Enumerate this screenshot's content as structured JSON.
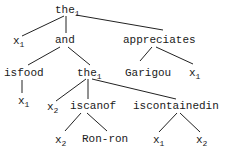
{
  "diagram": {
    "type": "tree",
    "nodes": [
      {
        "id": "n0",
        "label": "the",
        "sub": "1",
        "x": 55,
        "y": 4
      },
      {
        "id": "n1",
        "label": "x",
        "sub": "1",
        "x": 13,
        "y": 35
      },
      {
        "id": "n2",
        "label": "and",
        "sub": "",
        "x": 55,
        "y": 34
      },
      {
        "id": "n3",
        "label": "appreciates",
        "sub": "",
        "x": 123,
        "y": 34
      },
      {
        "id": "n4",
        "label": "isfood",
        "sub": "",
        "x": 4,
        "y": 67
      },
      {
        "id": "n5",
        "label": "the",
        "sub": "1",
        "x": 77,
        "y": 67
      },
      {
        "id": "n6",
        "label": "Garigou",
        "sub": "",
        "x": 125,
        "y": 67
      },
      {
        "id": "n7",
        "label": "x",
        "sub": "1",
        "x": 189,
        "y": 67
      },
      {
        "id": "n8",
        "label": "x",
        "sub": "1",
        "x": 18,
        "y": 95
      },
      {
        "id": "n9",
        "label": "x",
        "sub": "2",
        "x": 47,
        "y": 101
      },
      {
        "id": "n10",
        "label": "iscanof",
        "sub": "",
        "x": 70,
        "y": 100
      },
      {
        "id": "n11",
        "label": "iscontainedin",
        "sub": "",
        "x": 133,
        "y": 100
      },
      {
        "id": "n12",
        "label": "x",
        "sub": "2",
        "x": 55,
        "y": 134
      },
      {
        "id": "n13",
        "label": "Ron-ron",
        "sub": "",
        "x": 82,
        "y": 133
      },
      {
        "id": "n14",
        "label": "x",
        "sub": "1",
        "x": 153,
        "y": 134
      },
      {
        "id": "n15",
        "label": "x",
        "sub": "2",
        "x": 196,
        "y": 134
      }
    ],
    "edges": [
      {
        "from": "n0",
        "to": "n1",
        "x1": 64,
        "y1": 16,
        "x2": 22,
        "y2": 36
      },
      {
        "from": "n0",
        "to": "n2",
        "x1": 66,
        "y1": 16,
        "x2": 66,
        "y2": 33
      },
      {
        "from": "n0",
        "to": "n3",
        "x1": 76,
        "y1": 15,
        "x2": 163,
        "y2": 30
      },
      {
        "from": "n2",
        "to": "n4",
        "x1": 60,
        "y1": 47,
        "x2": 28,
        "y2": 65
      },
      {
        "from": "n2",
        "to": "n5",
        "x1": 68,
        "y1": 47,
        "x2": 90,
        "y2": 65
      },
      {
        "from": "n3",
        "to": "n6",
        "x1": 152,
        "y1": 47,
        "x2": 140,
        "y2": 61
      },
      {
        "from": "n3",
        "to": "n7",
        "x1": 156,
        "y1": 47,
        "x2": 193,
        "y2": 64
      },
      {
        "from": "n4",
        "to": "n8",
        "x1": 22,
        "y1": 80,
        "x2": 22,
        "y2": 93
      },
      {
        "from": "n5",
        "to": "n9",
        "x1": 86,
        "y1": 79,
        "x2": 56,
        "y2": 101
      },
      {
        "from": "n5",
        "to": "n10",
        "x1": 88,
        "y1": 79,
        "x2": 88,
        "y2": 99
      },
      {
        "from": "n5",
        "to": "n11",
        "x1": 92,
        "y1": 79,
        "x2": 176,
        "y2": 99
      },
      {
        "from": "n10",
        "to": "n12",
        "x1": 81,
        "y1": 113,
        "x2": 65,
        "y2": 131
      },
      {
        "from": "n10",
        "to": "n13",
        "x1": 87,
        "y1": 113,
        "x2": 107,
        "y2": 131
      },
      {
        "from": "n11",
        "to": "n14",
        "x1": 177,
        "y1": 113,
        "x2": 159,
        "y2": 132
      },
      {
        "from": "n11",
        "to": "n15",
        "x1": 180,
        "y1": 113,
        "x2": 200,
        "y2": 132
      }
    ]
  }
}
